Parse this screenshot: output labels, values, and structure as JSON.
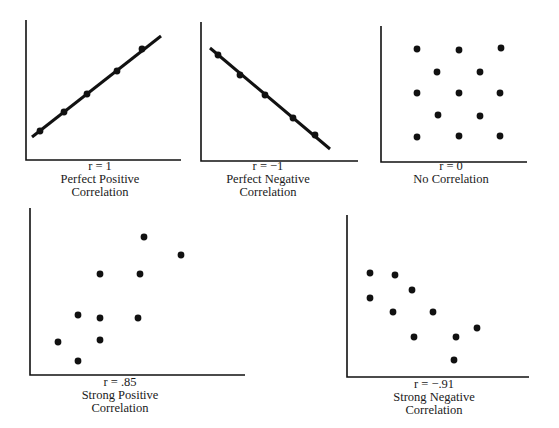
{
  "chart_data": [
    {
      "type": "scatter",
      "id": "perfect-positive",
      "r_label": "r = 1",
      "title_lines": [
        "Perfect Positive",
        "Correlation"
      ],
      "axes": {
        "origin": [
          26,
          160
        ],
        "top": 20,
        "right": 181
      },
      "fit_line": [
        [
          32,
          137
        ],
        [
          161,
          36
        ]
      ],
      "points": [
        [
          40,
          131
        ],
        [
          64,
          112
        ],
        [
          87,
          94
        ],
        [
          117,
          71
        ],
        [
          142,
          49
        ]
      ],
      "caption_center_x": 100,
      "caption_top": 160,
      "grid": false
    },
    {
      "type": "scatter",
      "id": "perfect-negative",
      "r_label": "r = −1",
      "title_lines": [
        "Perfect Negative",
        "Correlation"
      ],
      "axes": {
        "origin": [
          201,
          161
        ],
        "top": 22,
        "right": 358
      },
      "fit_line": [
        [
          210,
          48
        ],
        [
          330,
          149
        ]
      ],
      "points": [
        [
          218,
          55
        ],
        [
          240,
          75
        ],
        [
          265,
          95
        ],
        [
          293,
          118
        ],
        [
          315,
          135
        ]
      ],
      "caption_center_x": 268,
      "caption_top": 160,
      "grid": false
    },
    {
      "type": "scatter",
      "id": "no-correlation",
      "r_label": "r = 0",
      "title_lines": [
        "No Correlation"
      ],
      "axes": {
        "origin": [
          381,
          162
        ],
        "top": 26,
        "right": 527
      },
      "fit_line": null,
      "points": [
        [
          417,
          49
        ],
        [
          459,
          50
        ],
        [
          501,
          48
        ],
        [
          437,
          72
        ],
        [
          480,
          72
        ],
        [
          417,
          93
        ],
        [
          459,
          93
        ],
        [
          500,
          93
        ],
        [
          438,
          115
        ],
        [
          480,
          116
        ],
        [
          417,
          137
        ],
        [
          459,
          136
        ],
        [
          500,
          136
        ]
      ],
      "caption_center_x": 451,
      "caption_top": 160,
      "grid": false
    },
    {
      "type": "scatter",
      "id": "strong-positive",
      "r_label": "r = .85",
      "title_lines": [
        "Strong Positive",
        "Correlation"
      ],
      "axes": {
        "origin": [
          30,
          375
        ],
        "top": 208,
        "right": 245
      },
      "fit_line": null,
      "points": [
        [
          58,
          342
        ],
        [
          78,
          315
        ],
        [
          78,
          361
        ],
        [
          100,
          274
        ],
        [
          100,
          318
        ],
        [
          100,
          340
        ],
        [
          140,
          274
        ],
        [
          138,
          318
        ],
        [
          144,
          237
        ],
        [
          181,
          255
        ]
      ],
      "caption_center_x": 120,
      "caption_top": 376,
      "grid": false
    },
    {
      "type": "scatter",
      "id": "strong-negative",
      "r_label": "r = −.91",
      "title_lines": [
        "Strong Negative",
        "Correlation"
      ],
      "axes": {
        "origin": [
          347,
          377
        ],
        "top": 215,
        "right": 529
      },
      "fit_line": null,
      "points": [
        [
          370,
          273
        ],
        [
          395,
          275
        ],
        [
          412,
          290
        ],
        [
          370,
          298
        ],
        [
          393,
          312
        ],
        [
          433,
          312
        ],
        [
          414,
          337
        ],
        [
          456,
          337
        ],
        [
          477,
          328
        ],
        [
          454,
          360
        ]
      ],
      "caption_center_x": 434,
      "caption_top": 378,
      "grid": false
    }
  ],
  "style": {
    "ink": "#111111",
    "background": "#ffffff",
    "point_radius": 3.4,
    "axis_width": 1.6,
    "line_width": 3
  }
}
